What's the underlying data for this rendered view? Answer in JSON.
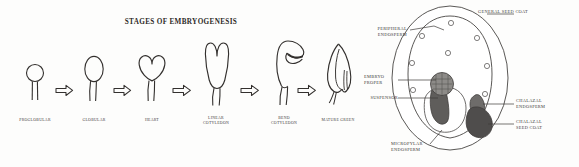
{
  "figure": {
    "background_color": "#fdfdfc",
    "ink_color": "#33302e"
  },
  "left_panel": {
    "title": "STAGES OF EMBRYOGENESIS",
    "arrow_glyph": "arrow-right",
    "stages": [
      {
        "id": "proglobular",
        "label": "PROGLOBULAR",
        "shape": "circle-on-stalk"
      },
      {
        "id": "globular",
        "label": "GLOBULAR",
        "shape": "oval-on-stalk"
      },
      {
        "id": "heart",
        "label": "HEART",
        "shape": "heart-on-stalk"
      },
      {
        "id": "linear-cotyledon",
        "label": "LINEAR\nCOTYLEDON",
        "shape": "two-lobe-elongated"
      },
      {
        "id": "bend-cotyledon",
        "label": "BEND\nCOTYLEDON",
        "shape": "hooked-bent"
      },
      {
        "id": "mature-green",
        "label": "MATURE GREEN",
        "shape": "mature-seed-embryo"
      }
    ]
  },
  "right_panel": {
    "diagram_name": "seed-cross-section",
    "labels": [
      {
        "id": "general-seed-coat",
        "text": "GENERAL SEED COAT",
        "align": "left"
      },
      {
        "id": "peripheral-endosperm",
        "text": "PERIPHERAL\nENDOSPERM",
        "align": "right"
      },
      {
        "id": "embryo-proper",
        "text": "EMBRYO\nPROPER",
        "align": "left"
      },
      {
        "id": "suspensor",
        "text": "SUSPENSOR",
        "align": "right"
      },
      {
        "id": "chalazal-endosperm",
        "text": "CHALAZAL\nENDOSPERM",
        "align": "left"
      },
      {
        "id": "chalazal-seed-coat",
        "text": "CHALAZAL\nSEED COAT",
        "align": "left"
      },
      {
        "id": "micropylar-endosperm",
        "text": "MICROPYLAR\nENDOSPERM",
        "align": "left"
      }
    ],
    "region_colors": {
      "embryo_proper": "#8d8b88",
      "suspensor": "#5f5d5b",
      "micropylar_endosperm": "#ffffff",
      "chalazal_endosperm": "#6e6c6a",
      "chalazal_seed_coat": "#4f4d4c",
      "seed_coat_outline": "#3c3a38"
    }
  }
}
